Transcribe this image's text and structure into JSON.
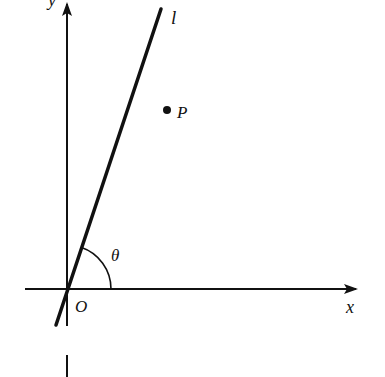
{
  "diagram": {
    "labels": {
      "y_axis": "y",
      "x_axis": "x",
      "line": "l",
      "point": "P",
      "angle": "θ",
      "origin": "O"
    },
    "colors": {
      "stroke": "#111111",
      "background": "#ffffff"
    },
    "geometry": {
      "origin": [
        67,
        289
      ],
      "x_axis": {
        "from": [
          25,
          289
        ],
        "to": [
          358,
          289
        ]
      },
      "y_axis": {
        "from": [
          67,
          326
        ],
        "to": [
          67,
          2
        ]
      },
      "y_axis_stub": {
        "from": [
          67,
          355
        ],
        "to": [
          67,
          377
        ]
      },
      "line_l": {
        "from": [
          56,
          325
        ],
        "to": [
          161,
          9
        ]
      },
      "point_P": [
        167,
        110
      ],
      "angle_arc_radius": 44
    }
  }
}
